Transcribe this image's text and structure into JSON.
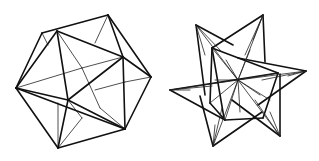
{
  "figures": [
    {
      "name": "left-polyhedron",
      "description": "Great dodecahedron-like polyhedron in hexagonal outline, line drawing",
      "stroke_color": "#111111",
      "outline": [
        [
          42,
          33
        ],
        [
          108,
          15
        ],
        [
          151,
          77
        ],
        [
          125,
          129
        ],
        [
          58,
          148
        ],
        [
          16,
          88
        ]
      ],
      "thick_edges": [
        [
          [
            42,
            33
          ],
          [
            108,
            15
          ]
        ],
        [
          [
            108,
            15
          ],
          [
            151,
            77
          ]
        ],
        [
          [
            151,
            77
          ],
          [
            125,
            129
          ]
        ],
        [
          [
            125,
            129
          ],
          [
            58,
            148
          ]
        ],
        [
          [
            58,
            148
          ],
          [
            16,
            88
          ]
        ],
        [
          [
            16,
            88
          ],
          [
            42,
            33
          ]
        ],
        [
          [
            57,
            31
          ],
          [
            16,
            88
          ]
        ],
        [
          [
            57,
            31
          ],
          [
            68,
            100
          ]
        ],
        [
          [
            57,
            31
          ],
          [
            123,
            57
          ]
        ],
        [
          [
            108,
            15
          ],
          [
            123,
            57
          ]
        ],
        [
          [
            123,
            57
          ],
          [
            125,
            129
          ]
        ],
        [
          [
            123,
            57
          ],
          [
            68,
            100
          ]
        ],
        [
          [
            151,
            77
          ],
          [
            123,
            57
          ]
        ],
        [
          [
            16,
            88
          ],
          [
            68,
            100
          ]
        ],
        [
          [
            68,
            100
          ],
          [
            125,
            129
          ]
        ],
        [
          [
            68,
            100
          ],
          [
            58,
            148
          ]
        ],
        [
          [
            16,
            88
          ],
          [
            125,
            129
          ]
        ]
      ],
      "thin_edges": [
        [
          [
            42,
            33
          ],
          [
            48,
            45
          ]
        ],
        [
          [
            57,
            31
          ],
          [
            82,
            68
          ]
        ],
        [
          [
            82,
            68
          ],
          [
            16,
            88
          ]
        ],
        [
          [
            82,
            68
          ],
          [
            123,
            57
          ]
        ],
        [
          [
            95,
            43
          ],
          [
            108,
            15
          ]
        ],
        [
          [
            125,
            82
          ],
          [
            151,
            77
          ]
        ],
        [
          [
            125,
            82
          ],
          [
            95,
            90
          ]
        ],
        [
          [
            58,
            103
          ],
          [
            58,
            148
          ]
        ],
        [
          [
            82,
            118
          ],
          [
            58,
            148
          ]
        ],
        [
          [
            82,
            118
          ],
          [
            68,
            100
          ]
        ],
        [
          [
            100,
            108
          ],
          [
            125,
            129
          ]
        ],
        [
          [
            100,
            108
          ],
          [
            82,
            68
          ]
        ]
      ]
    },
    {
      "name": "right-star-polyhedron",
      "description": "Small stellated dodecahedron-like star polyhedron, line drawing",
      "stroke_color": "#111111",
      "tips": [
        [
          196,
          25
        ],
        [
          263,
          15
        ],
        [
          306,
          71
        ],
        [
          280,
          136
        ],
        [
          213,
          146
        ],
        [
          170,
          90
        ]
      ],
      "center": [
        238,
        80
      ],
      "inner": [
        [
          212,
          48
        ],
        [
          278,
          73
        ],
        [
          270,
          100
        ],
        [
          225,
          120
        ],
        [
          210,
          103
        ]
      ]
    }
  ]
}
